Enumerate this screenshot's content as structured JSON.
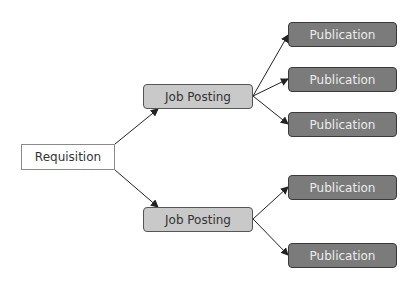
{
  "diagram": {
    "root": {
      "label": "Requisition"
    },
    "job_postings": [
      {
        "label": "Job Posting",
        "publications": [
          {
            "label": "Publication"
          },
          {
            "label": "Publication"
          },
          {
            "label": "Publication"
          }
        ]
      },
      {
        "label": "Job Posting",
        "publications": [
          {
            "label": "Publication"
          },
          {
            "label": "Publication"
          }
        ]
      }
    ],
    "colors": {
      "requisition_fill": "#ffffff",
      "job_posting_fill": "#c9c9c9",
      "publication_fill": "#7b7b7b",
      "publication_text": "#ececec",
      "arrow": "#222222"
    }
  }
}
